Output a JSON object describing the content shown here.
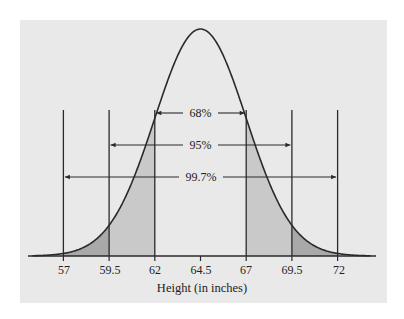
{
  "chart_data": {
    "type": "area",
    "title": "",
    "xlabel": "Height (in inches)",
    "ylabel": "",
    "distribution": "normal",
    "mean": 64.5,
    "std": 2.5,
    "x_ticks": [
      57,
      59.5,
      62,
      64.5,
      67,
      69.5,
      72
    ],
    "x_tick_labels": [
      "57",
      "59.5",
      "62",
      "64.5",
      "67",
      "69.5",
      "72"
    ],
    "xlim": [
      55.8,
      73.6
    ],
    "grid": false,
    "legend": null,
    "intervals": [
      {
        "label": "68%",
        "from": 62,
        "to": 67,
        "sigma": 1
      },
      {
        "label": "95%",
        "from": 59.5,
        "to": 69.5,
        "sigma": 2
      },
      {
        "label": "99.7%",
        "from": 57,
        "to": 72,
        "sigma": 3
      }
    ],
    "shaded_regions": [
      {
        "from": 59.5,
        "to": 62,
        "shade": "light"
      },
      {
        "from": 67,
        "to": 69.5,
        "shade": "light"
      },
      {
        "from": 57,
        "to": 59.5,
        "shade": "dark"
      },
      {
        "from": 69.5,
        "to": 72,
        "shade": "dark"
      }
    ]
  },
  "colors": {
    "panel_bg": "#e9e9e9",
    "light_shade": "#c9c9c9",
    "dark_shade": "#a9a9a9",
    "line": "#2a2a2a"
  },
  "labels": {
    "interval_68": "68%",
    "interval_95": "95%",
    "interval_997": "99.7%",
    "xaxis_title": "Height (in inches)",
    "ticks": [
      "57",
      "59.5",
      "62",
      "64.5",
      "67",
      "69.5",
      "72"
    ]
  }
}
